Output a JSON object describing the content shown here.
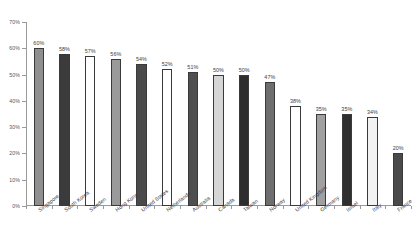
{
  "chart_data": {
    "type": "bar",
    "title": "",
    "subtitle": "",
    "xlabel": "",
    "ylabel": "",
    "ylim": [
      0,
      70
    ],
    "ytick_labels": [
      "0%",
      "10%",
      "20%",
      "30%",
      "40%",
      "50%",
      "60%",
      "70%"
    ],
    "ytick_values": [
      0,
      10,
      20,
      30,
      40,
      50,
      60,
      70
    ],
    "grid": false,
    "legend": "none",
    "value_suffix": "%",
    "categories": [
      "Singapore",
      "South Korea",
      "Sweden",
      "Hong Kong",
      "United States",
      "Netherlands",
      "Australia",
      "Canada",
      "Taiwan",
      "Norway",
      "United Kingdom",
      "Germany",
      "Israel",
      "Italy",
      "France"
    ],
    "values": [
      60,
      58,
      57,
      56,
      54,
      52,
      51,
      50,
      50,
      47,
      38,
      35,
      35,
      34,
      20
    ],
    "data_labels": [
      "60%",
      "58%",
      "57%",
      "56%",
      "54%",
      "52%",
      "51%",
      "50%",
      "50%",
      "47%",
      "38%",
      "35%",
      "35%",
      "34%",
      "20%"
    ],
    "bar_fills": [
      "#8f8f8f",
      "#3b3b3b",
      "#ffffff",
      "#9a9a9a",
      "#4a4a4a",
      "#ffffff",
      "#4f4f4f",
      "#d6d6d6",
      "#2e2e2e",
      "#6e6e6e",
      "#ffffff",
      "#a0a0a0",
      "#2f2f2f",
      "#f2f2f2",
      "#4a4a4a"
    ],
    "bar_border_color": "#3a3a3a",
    "axis_color": "#9a9a9a",
    "text_color": "#3b3b3b",
    "background": "#ffffff"
  }
}
